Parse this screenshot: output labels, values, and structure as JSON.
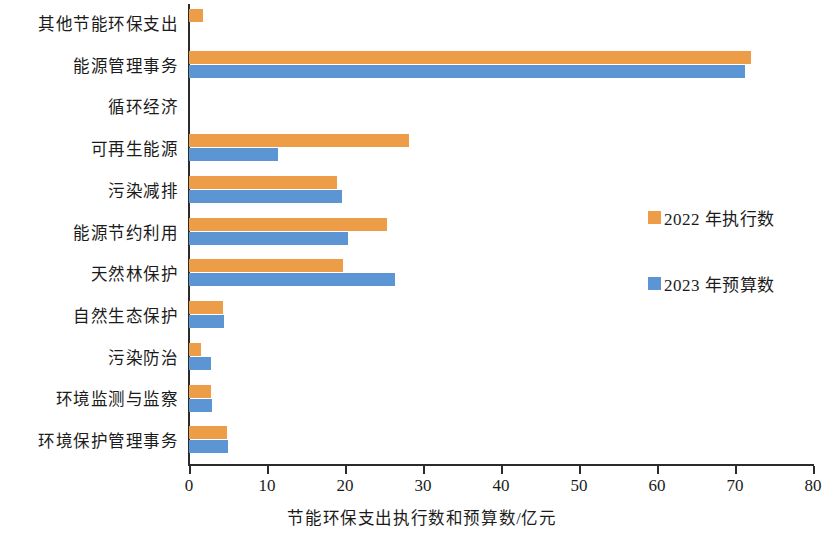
{
  "chart_data": {
    "type": "bar",
    "orientation": "horizontal",
    "title": "",
    "xlabel": "节能环保支出执行数和预算数/亿元",
    "ylabel": "",
    "xlim": [
      0,
      80
    ],
    "xticks": [
      0,
      10,
      20,
      30,
      40,
      50,
      60,
      70,
      80
    ],
    "grid": false,
    "legend_position": "right",
    "categories": [
      "其他节能环保支出",
      "能源管理事务",
      "循环经济",
      "可再生能源",
      "污染减排",
      "能源节约利用",
      "天然林保护",
      "自然生态保护",
      "污染防治",
      "环境监测与监察",
      "环境保护管理事务"
    ],
    "series": [
      {
        "name": "2022 年执行数",
        "color": "#ed9d47",
        "values": [
          1.8,
          72.0,
          0.0,
          28.2,
          19.0,
          25.4,
          19.8,
          4.4,
          1.6,
          2.8,
          4.9
        ]
      },
      {
        "name": "2023 年预算数",
        "color": "#5b95d3",
        "values": [
          0.0,
          71.3,
          0.0,
          11.4,
          19.6,
          20.4,
          26.4,
          4.5,
          2.8,
          3.0,
          5.0
        ]
      }
    ]
  },
  "axis": {
    "x_title": "节能环保支出执行数和预算数/亿元"
  },
  "legend": {
    "items": [
      {
        "label": "2022 年执行数",
        "color": "#ed9d47"
      },
      {
        "label": "2023 年预算数",
        "color": "#5b95d3"
      }
    ]
  }
}
